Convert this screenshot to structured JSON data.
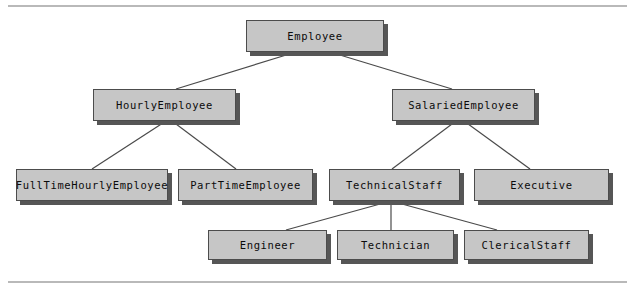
{
  "diagram": {
    "type": "class-inheritance-hierarchy",
    "colors": {
      "node_fill": "#c6c6c6",
      "node_border": "#4c4c4c",
      "node_shadow": "#565656",
      "edge": "#4a4a4a",
      "rule": "#b9b9b9",
      "text": "#0b0b0b",
      "background": "#ffffff"
    },
    "nodes": [
      {
        "id": "employee",
        "label": "Employee",
        "x": 246,
        "y": 20,
        "w": 138,
        "h": 32,
        "level": 0
      },
      {
        "id": "hourly_employee",
        "label": "HourlyEmployee",
        "x": 93,
        "y": 89,
        "w": 143,
        "h": 32,
        "level": 1
      },
      {
        "id": "salaried_employee",
        "label": "SalariedEmployee",
        "x": 392,
        "y": 89,
        "w": 143,
        "h": 32,
        "level": 1
      },
      {
        "id": "fulltime_hourly",
        "label": "FullTimeHourlyEmployee",
        "x": 16,
        "y": 169,
        "w": 152,
        "h": 32,
        "level": 2
      },
      {
        "id": "parttime_employee",
        "label": "PartTimeEmployee",
        "x": 178,
        "y": 169,
        "w": 135,
        "h": 32,
        "level": 2
      },
      {
        "id": "technical_staff",
        "label": "TechnicalStaff",
        "x": 329,
        "y": 169,
        "w": 131,
        "h": 32,
        "level": 2
      },
      {
        "id": "executive",
        "label": "Executive",
        "x": 474,
        "y": 169,
        "w": 135,
        "h": 32,
        "level": 2
      },
      {
        "id": "engineer",
        "label": "Engineer",
        "x": 208,
        "y": 230,
        "w": 119,
        "h": 30,
        "level": 3
      },
      {
        "id": "technician",
        "label": "Technician",
        "x": 337,
        "y": 230,
        "w": 117,
        "h": 30,
        "level": 3
      },
      {
        "id": "clerical_staff",
        "label": "ClericalStaff",
        "x": 464,
        "y": 230,
        "w": 125,
        "h": 30,
        "level": 3
      }
    ],
    "edges": [
      {
        "from": "employee",
        "to": "hourly_employee",
        "x1": 296,
        "y1": 52,
        "x2": 176,
        "y2": 89
      },
      {
        "from": "employee",
        "to": "salaried_employee",
        "x1": 330,
        "y1": 52,
        "x2": 452,
        "y2": 89
      },
      {
        "from": "hourly_employee",
        "to": "fulltime_hourly",
        "x1": 166,
        "y1": 121,
        "x2": 92,
        "y2": 169
      },
      {
        "from": "hourly_employee",
        "to": "parttime_employee",
        "x1": 172,
        "y1": 121,
        "x2": 236,
        "y2": 169
      },
      {
        "from": "salaried_employee",
        "to": "technical_staff",
        "x1": 456,
        "y1": 121,
        "x2": 392,
        "y2": 169
      },
      {
        "from": "salaried_employee",
        "to": "executive",
        "x1": 464,
        "y1": 121,
        "x2": 530,
        "y2": 169
      },
      {
        "from": "technical_staff",
        "to": "engineer",
        "x1": 391,
        "y1": 201,
        "x2": 286,
        "y2": 230
      },
      {
        "from": "technical_staff",
        "to": "technician",
        "x1": 391,
        "y1": 201,
        "x2": 391,
        "y2": 230
      },
      {
        "from": "technical_staff",
        "to": "clerical_staff",
        "x1": 391,
        "y1": 201,
        "x2": 497,
        "y2": 230
      }
    ]
  }
}
